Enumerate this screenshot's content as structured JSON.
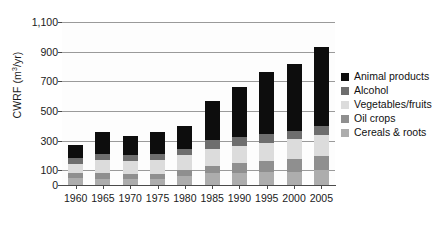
{
  "chart_data": {
    "type": "bar",
    "stacked": true,
    "title": "",
    "xlabel": "",
    "ylabel": "CWRF (m3/yr)",
    "ylabel_display": "CWRF (m³/yr)",
    "categories": [
      "1960",
      "1965",
      "1970",
      "1975",
      "1980",
      "1985",
      "1990",
      "1995",
      "2000",
      "2005"
    ],
    "ylim": [
      0,
      1100
    ],
    "yticks": [
      0,
      100,
      300,
      500,
      700,
      900,
      1100
    ],
    "ytick_labels": [
      "0",
      "100",
      "300",
      "500",
      "700",
      "900",
      "1,100"
    ],
    "grid": true,
    "legend_position": "right",
    "series": [
      {
        "name": "Cereals & roots",
        "color": "#adadad",
        "values": [
          48,
          42,
          42,
          40,
          62,
          78,
          80,
          86,
          88,
          104
        ]
      },
      {
        "name": "Oil crops",
        "color": "#8f8f8f",
        "values": [
          32,
          36,
          34,
          36,
          42,
          52,
          66,
          76,
          88,
          92
        ]
      },
      {
        "name": "Vegetables/fruits",
        "color": "#dcdcdc",
        "values": [
          64,
          88,
          84,
          90,
          96,
          114,
          120,
          124,
          134,
          142
        ]
      },
      {
        "name": "Alcohol",
        "color": "#6e6e6e",
        "values": [
          38,
          42,
          40,
          42,
          44,
          58,
          58,
          56,
          56,
          58
        ]
      },
      {
        "name": "Animal products",
        "color": "#0d0d0d",
        "values": [
          88,
          148,
          132,
          152,
          156,
          268,
          336,
          418,
          454,
          534
        ]
      }
    ],
    "totals": [
      270,
      356,
      332,
      360,
      400,
      570,
      660,
      760,
      820,
      930
    ],
    "legend_order_displayed": [
      "Animal products",
      "Alcohol",
      "Vegetables/fruits",
      "Oil crops",
      "Cereals & roots"
    ]
  },
  "legend": {
    "items": [
      {
        "label": "Animal products",
        "color": "#0d0d0d",
        "swatch_name": "legend-swatch-animal-products"
      },
      {
        "label": "Alcohol",
        "color": "#6e6e6e",
        "swatch_name": "legend-swatch-alcohol"
      },
      {
        "label": "Vegetables/fruits",
        "color": "#dcdcdc",
        "swatch_name": "legend-swatch-vegetables-fruits"
      },
      {
        "label": "Oil crops",
        "color": "#8f8f8f",
        "swatch_name": "legend-swatch-oil-crops"
      },
      {
        "label": "Cereals & roots",
        "color": "#adadad",
        "swatch_name": "legend-swatch-cereals-roots"
      }
    ]
  },
  "colors": {
    "axis": "#4a4a4a",
    "gridline": "#9a9a9a",
    "text": "#1a1a1a",
    "background": "#ffffff",
    "plot_background": "#fdfdfd"
  }
}
